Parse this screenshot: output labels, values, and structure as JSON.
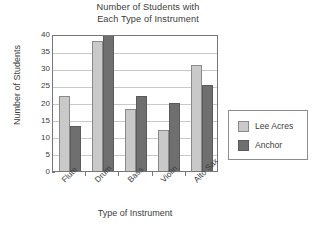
{
  "chart_data": {
    "type": "bar",
    "title": "Number of Students with Each Type of Instrument",
    "title_lines": [
      "Number of Students with",
      "Each Type of Instrument"
    ],
    "xlabel": "Type of Instrument",
    "ylabel": "Number of Students",
    "categories": [
      "Flute",
      "Drum",
      "Bass",
      "Violin",
      "Alto Sax"
    ],
    "series": [
      {
        "name": "Lee Acres",
        "color": "#c9c9c9",
        "values": [
          22,
          38,
          18,
          12,
          31
        ]
      },
      {
        "name": "Anchor",
        "color": "#6f6f6f",
        "values": [
          13,
          40,
          22,
          20,
          25
        ]
      }
    ],
    "ylim": [
      0,
      40
    ],
    "ytick_values": [
      0,
      5,
      10,
      15,
      20,
      25,
      30,
      35,
      40
    ],
    "ytick_labels": [
      "0",
      "5",
      "10",
      "15",
      "20",
      "25",
      "30",
      "35",
      "40"
    ],
    "grid": true,
    "legend_position": "right"
  },
  "legend": {
    "entries": [
      {
        "label": "Lee Acres",
        "swatch": "legend-swatch-lee-acres"
      },
      {
        "label": "Anchor",
        "swatch": "legend-swatch-anchor"
      }
    ]
  }
}
